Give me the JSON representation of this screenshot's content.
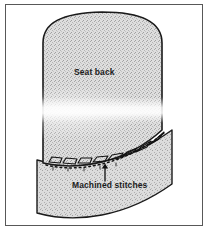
{
  "figure": {
    "frame_color": "#585858",
    "background_color": "#ffffff",
    "ink_color": "#1a1a1a",
    "fill_color": "#d9d9d9"
  },
  "labels": {
    "seat_back": "Seat back",
    "machined_stitches": "Machined stitches"
  },
  "annotations": {
    "leader_arrow": "arrow-up-pointer"
  },
  "parts": {
    "seat_back_panel": "seat-back-panel",
    "lower_panel": "lower-seat-panel",
    "seam_line": "stitched-seam-line",
    "stitch_loops": "stitch-loop-row"
  }
}
